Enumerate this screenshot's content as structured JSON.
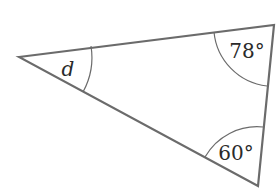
{
  "diagram": {
    "type": "triangle",
    "stroke_color": "#6b6b6b",
    "vertices": {
      "left": {
        "x": 19,
        "y": 57
      },
      "top_right": {
        "x": 274,
        "y": 25
      },
      "bottom_right": {
        "x": 258,
        "y": 186
      }
    },
    "angles": [
      {
        "vertex": "left",
        "label": "d",
        "unknown": true
      },
      {
        "vertex": "top_right",
        "label": "78°",
        "value_deg": 78
      },
      {
        "vertex": "bottom_right",
        "label": "60°",
        "value_deg": 60
      }
    ]
  }
}
